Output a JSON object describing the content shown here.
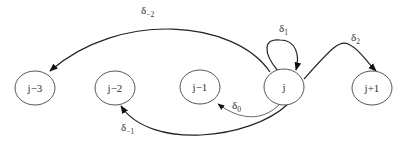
{
  "diagram": {
    "type": "state-transition",
    "nodes": [
      {
        "id": "n_jm3",
        "label": "j−3"
      },
      {
        "id": "n_jm2",
        "label": "j−2"
      },
      {
        "id": "n_jm1",
        "label": "j−1"
      },
      {
        "id": "n_j",
        "label": "j"
      },
      {
        "id": "n_jp1",
        "label": "j+1"
      }
    ],
    "edges": [
      {
        "from": "j",
        "to": "j−3",
        "label_base": "δ",
        "label_sub": "−2"
      },
      {
        "from": "j",
        "to": "j−2",
        "label_base": "δ",
        "label_sub": "−1"
      },
      {
        "from": "j",
        "to": "j−1",
        "label_base": "δ",
        "label_sub": "0"
      },
      {
        "from": "j",
        "to": "j",
        "label_base": "δ",
        "label_sub": "1"
      },
      {
        "from": "j",
        "to": "j+1",
        "label_base": "δ",
        "label_sub": "2"
      }
    ]
  }
}
